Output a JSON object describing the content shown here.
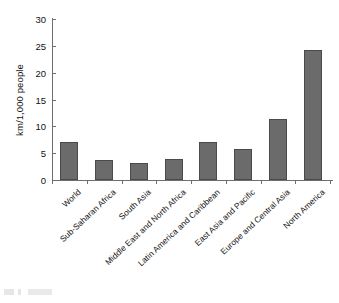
{
  "chart_data": {
    "type": "bar",
    "title": "",
    "xlabel": "",
    "ylabel": "km/1,000 people",
    "ylim": [
      0,
      30
    ],
    "yticks": [
      0,
      5,
      10,
      15,
      20,
      25,
      30
    ],
    "grid": false,
    "legend": null,
    "bar_color": "#6b6b6b",
    "bar_edge_color": "#4a4a4a",
    "axis_color": "#6e6e6e",
    "categories": [
      "World",
      "Sub-Saharan Africa",
      "South Asia",
      "Middle East and North Africa",
      "Latin America and Caribbean",
      "East Asia and Pacific",
      "Europe and Central Asia",
      "North America"
    ],
    "values": [
      7.0,
      3.7,
      3.2,
      3.9,
      7.0,
      5.7,
      11.4,
      24.2
    ]
  }
}
